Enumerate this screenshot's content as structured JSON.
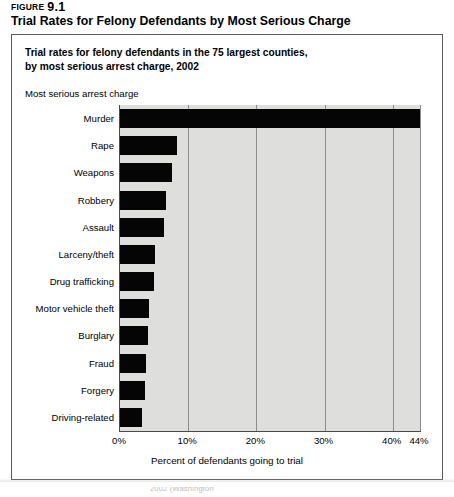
{
  "figure": {
    "label_word": "FIGURE",
    "number": "9.1",
    "title": "Trial Rates for Felony Defendants by Most Serious Charge"
  },
  "panel": {
    "subtitle_line1": "Trial rates for felony defendants in the 75 largest counties,",
    "subtitle_line2": "by most serious arrest charge, 2002",
    "y_axis_caption": "Most serious arrest charge"
  },
  "source_note": "2002 (Washington",
  "colors": {
    "bar": "#050505",
    "plot_background": "#dededd",
    "gridline": "#8d8d8d",
    "axis": "#4a4a4a",
    "panel_border": "#5a5a5a"
  },
  "chart_data": {
    "type": "bar",
    "orientation": "horizontal",
    "title": "Trial rates for felony defendants in the 75 largest counties, by most serious arrest charge, 2002",
    "xlabel": "Percent of defendants going to trial",
    "ylabel": "Most serious arrest charge",
    "xlim": [
      0,
      44
    ],
    "xticks": [
      0,
      10,
      20,
      30,
      40,
      44
    ],
    "xticklabels": [
      "0%",
      "10%",
      "20%",
      "30%",
      "40%",
      "44%"
    ],
    "grid": "vertical",
    "legend": "none",
    "categories": [
      "Murder",
      "Rape",
      "Weapons",
      "Robbery",
      "Assault",
      "Larceny/theft",
      "Drug trafficking",
      "Motor vehicle theft",
      "Burglary",
      "Fraud",
      "Forgery",
      "Driving-related"
    ],
    "values": [
      44,
      8.3,
      7.6,
      6.8,
      6.4,
      5.2,
      5.0,
      4.2,
      4.1,
      3.8,
      3.6,
      3.2
    ]
  }
}
